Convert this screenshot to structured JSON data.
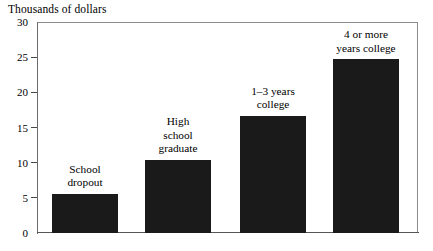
{
  "figure": {
    "axis_title": "Thousands of dollars"
  },
  "chart_data": {
    "type": "bar",
    "title": "",
    "ylabel": "Thousands of dollars",
    "xlabel": "",
    "ylim": [
      0,
      30
    ],
    "yticks": [
      0,
      5,
      10,
      15,
      20,
      25,
      30
    ],
    "ytick_labels": [
      "0",
      "5",
      "10",
      "15",
      "20",
      "25",
      "30"
    ],
    "grid": false,
    "legend": false,
    "bar_color": "#1a1a1a",
    "categories": [
      "School dropout",
      "High school graduate",
      "1–3 years college",
      "4 or more years college"
    ],
    "values": [
      5.6,
      10.4,
      16.7,
      24.7
    ],
    "bars": [
      {
        "label_lines": [
          "School",
          "dropout"
        ],
        "value": 5.6,
        "left_px": 15,
        "width_px": 66
      },
      {
        "label_lines": [
          "High",
          "school",
          "graduate"
        ],
        "value": 10.4,
        "left_px": 108,
        "width_px": 66
      },
      {
        "label_lines": [
          "1–3 years",
          "college"
        ],
        "value": 16.7,
        "left_px": 203,
        "width_px": 66
      },
      {
        "label_lines": [
          "4 or more",
          "years college"
        ],
        "value": 24.7,
        "left_px": 296,
        "width_px": 66
      }
    ]
  }
}
